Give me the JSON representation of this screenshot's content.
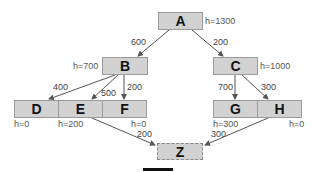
{
  "diagram": {
    "type": "search-tree-graph",
    "colors": {
      "node_fill": "#d2d2d2",
      "node_border": "#9a9a9a",
      "edge": "#555555"
    },
    "nodes": {
      "A": {
        "label": "A",
        "h": "h=1300"
      },
      "B": {
        "label": "B",
        "h": "h=700"
      },
      "C": {
        "label": "C",
        "h": "h=1000"
      },
      "D": {
        "label": "D",
        "h": "h=0"
      },
      "E": {
        "label": "E",
        "h": "h=200"
      },
      "F": {
        "label": "F",
        "h": "h=0"
      },
      "G": {
        "label": "G",
        "h": "h=300"
      },
      "H": {
        "label": "H",
        "h": "h=0"
      },
      "Z": {
        "label": "Z"
      }
    },
    "edges": [
      {
        "from": "A",
        "to": "B",
        "weight": "600"
      },
      {
        "from": "A",
        "to": "C",
        "weight": "200"
      },
      {
        "from": "B",
        "to": "D",
        "weight": "400"
      },
      {
        "from": "B",
        "to": "E",
        "weight": "500"
      },
      {
        "from": "B",
        "to": "F",
        "weight": "200"
      },
      {
        "from": "C",
        "to": "G",
        "weight": "700"
      },
      {
        "from": "C",
        "to": "H",
        "weight": "300"
      },
      {
        "from": "E",
        "to": "Z",
        "weight": "200"
      },
      {
        "from": "H",
        "to": "Z",
        "weight": "300"
      }
    ]
  }
}
